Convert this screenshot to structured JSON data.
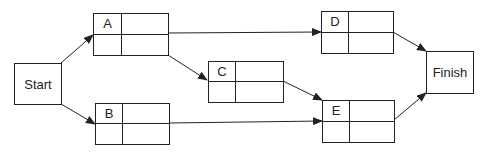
{
  "diagram": {
    "type": "activity-on-node network",
    "colors": {
      "line": "#222222",
      "background": "#ffffff"
    },
    "terminals": {
      "start": {
        "label": "Start"
      },
      "finish": {
        "label": "Finish"
      }
    },
    "nodes": [
      {
        "id": "A",
        "label": "A",
        "cells": [
          "",
          "",
          ""
        ]
      },
      {
        "id": "B",
        "label": "B",
        "cells": [
          "",
          "",
          ""
        ]
      },
      {
        "id": "C",
        "label": "C",
        "cells": [
          "",
          "",
          ""
        ]
      },
      {
        "id": "D",
        "label": "D",
        "cells": [
          "",
          "",
          ""
        ]
      },
      {
        "id": "E",
        "label": "E",
        "cells": [
          "",
          "",
          ""
        ]
      }
    ],
    "edges": [
      {
        "from": "Start",
        "to": "A"
      },
      {
        "from": "Start",
        "to": "B"
      },
      {
        "from": "A",
        "to": "D"
      },
      {
        "from": "A",
        "to": "C"
      },
      {
        "from": "C",
        "to": "E"
      },
      {
        "from": "B",
        "to": "E"
      },
      {
        "from": "D",
        "to": "Finish"
      },
      {
        "from": "E",
        "to": "Finish"
      }
    ]
  }
}
